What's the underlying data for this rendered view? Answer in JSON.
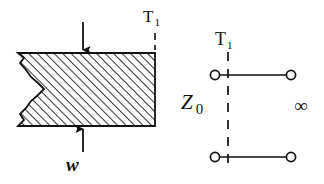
{
  "figure": {
    "background_color": "#ffffff",
    "ink_color": "#111111",
    "width": 324,
    "height": 184
  },
  "left_diagram": {
    "name": "loaded-specimen",
    "block": {
      "name": "hatched-specimen-block",
      "fill_pattern": "diagonal-hatch-45",
      "hatch_spacing_px": 6,
      "outline_color": "#111111",
      "left_edge_style": "broken-jagged",
      "bounds": {
        "x": 18,
        "y": 53,
        "width": 137,
        "height": 73
      }
    },
    "top_arrow": {
      "name": "load-arrow-down",
      "direction": "down",
      "x": 83,
      "y_from": 22,
      "y_to": 53
    },
    "bottom_arrow": {
      "name": "load-arrow-up",
      "direction": "up",
      "x": 83,
      "y_from": 152,
      "y_to": 126
    },
    "load_label": "w",
    "terminal_label": "T",
    "terminal_subscript": "1",
    "terminal_dash_line": {
      "name": "terminal-plane-dash",
      "x": 155,
      "y_from": 33,
      "y_to": 50,
      "style": "dashed"
    }
  },
  "right_diagram": {
    "name": "two-port-network",
    "terminal_label": "T",
    "terminal_subscript": "1",
    "impedance_label": "Z",
    "impedance_subscript": "0",
    "termination_label": "∞",
    "top_wire": {
      "name": "top-conductor",
      "x_from": 215,
      "x_to": 291,
      "y": 75
    },
    "bottom_wire": {
      "name": "bottom-conductor",
      "x_from": 215,
      "x_to": 291,
      "y": 157
    },
    "nodes": [
      {
        "name": "node-top-left",
        "cx": 215,
        "cy": 75,
        "r": 5
      },
      {
        "name": "node-top-right",
        "cx": 291,
        "cy": 75,
        "r": 5
      },
      {
        "name": "node-bottom-left",
        "cx": 215,
        "cy": 157,
        "r": 5
      },
      {
        "name": "node-bottom-right",
        "cx": 291,
        "cy": 157,
        "r": 5
      }
    ],
    "reference_plane": {
      "name": "reference-plane-dash",
      "x": 228,
      "y_from": 52,
      "y_to": 166,
      "style": "dashed"
    }
  }
}
